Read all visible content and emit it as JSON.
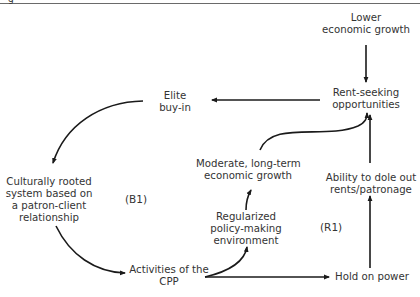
{
  "header": {
    "glyph": "g"
  },
  "nodes": {
    "lower_growth": {
      "lines": [
        "Lower",
        "economic growth"
      ]
    },
    "rent_seeking": {
      "lines": [
        "Rent-seeking",
        "opportunities"
      ]
    },
    "elite_buyin": {
      "lines": [
        "Elite",
        "buy-in"
      ]
    },
    "culturally_rooted": {
      "lines": [
        "Culturally rooted",
        "system based on",
        "a patron-client",
        "relationship"
      ]
    },
    "moderate_growth": {
      "lines": [
        "Moderate, long-term",
        "economic growth"
      ]
    },
    "regularized_policy": {
      "lines": [
        "Regularized",
        "policy-making",
        "environment"
      ]
    },
    "ability_dole": {
      "lines": [
        "Ability to dole out",
        "rents/patronage"
      ]
    },
    "activities_cpp": {
      "lines": [
        "Activities of the",
        "CPP"
      ]
    },
    "hold_power": {
      "lines": [
        "Hold on power"
      ]
    }
  },
  "loops": {
    "balancing": "(B1)",
    "reinforcing": "(R1)"
  },
  "colors": {
    "line": "#1a1a1a",
    "text": "#333333",
    "rule": "#6a6a6a"
  }
}
